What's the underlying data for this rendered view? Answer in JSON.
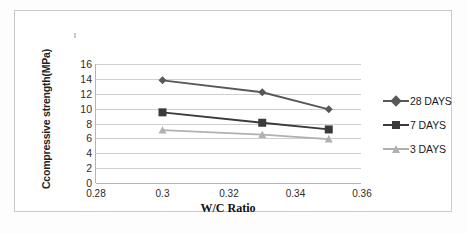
{
  "chart_data": {
    "type": "line",
    "title": "",
    "xlabel": "W/C Ratio",
    "ylabel": "Ccompressive strength(MPa)",
    "x": [
      0.3,
      0.33,
      0.35
    ],
    "xlim": [
      0.28,
      0.36
    ],
    "ylim": [
      0,
      16
    ],
    "xticks": [
      "0.28",
      "0.3",
      "0.32",
      "0.34",
      "0.36"
    ],
    "xtick_values": [
      0.28,
      0.3,
      0.32,
      0.34,
      0.36
    ],
    "yticks": [
      "0",
      "2",
      "4",
      "6",
      "8",
      "10",
      "12",
      "14",
      "16"
    ],
    "ytick_values": [
      0,
      2,
      4,
      6,
      8,
      10,
      12,
      14,
      16
    ],
    "grid": "horizontal",
    "legend_position": "right",
    "series": [
      {
        "name": "28 DAYS",
        "values": [
          13.8,
          12.2,
          9.9
        ],
        "color": "#585858",
        "marker": "diamond"
      },
      {
        "name": "7 DAYS",
        "values": [
          9.5,
          8.1,
          7.2
        ],
        "color": "#3a3a3a",
        "marker": "square"
      },
      {
        "name": "3 DAYS",
        "values": [
          7.1,
          6.5,
          5.9
        ],
        "color": "#b0b0b0",
        "marker": "triangle"
      }
    ]
  },
  "legend": {
    "items": [
      {
        "label": "28 DAYS"
      },
      {
        "label": "7 DAYS"
      },
      {
        "label": "3 DAYS"
      }
    ]
  },
  "axes": {
    "y_title": "Ccompressive strength(MPa)",
    "x_title": "W/C Ratio"
  },
  "colors": {
    "gridline": "#cfcfcf",
    "axis": "#b5b5b5",
    "frame_border": "#c9c9c9",
    "background": "#ffffff",
    "series_28_days": "#585858",
    "series_7_days": "#3a3a3a",
    "series_3_days": "#b0b0b0"
  }
}
